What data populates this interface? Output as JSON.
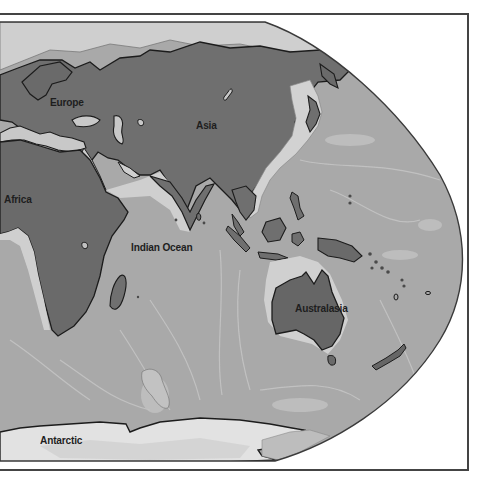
{
  "map": {
    "style": "grayscale physical world map, Robinson-like projection, eastern hemisphere right edge",
    "colors": {
      "frame": "#444444",
      "background": "#ffffff",
      "ocean": "#a9a9a9",
      "shelf": "#cdcdcd",
      "land": "#6f6f6f",
      "land_dark": "#5e5e5e",
      "ice": "#e3e3e3",
      "coastline": "#1c1c1c"
    },
    "labels": {
      "europe": "Europe",
      "asia": "Asia",
      "africa": "Africa",
      "indian_ocean": "Indian Ocean",
      "australasia": "Australasia",
      "antarctic": "Antarctic"
    }
  }
}
